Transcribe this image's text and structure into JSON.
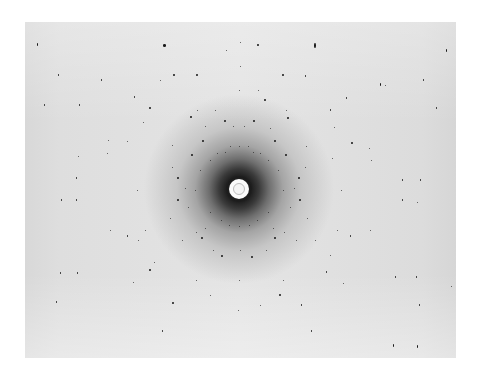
{
  "image": {
    "description": "X-ray diffraction photograph with concentric rings of dark reflection spots around a central white beam stop",
    "background_color": "#ffffff",
    "plate_color": "#e2e2e2",
    "spot_color": "#1a1a1a",
    "center": {
      "x": 239,
      "y": 189
    },
    "beam_stop_radius": 10
  },
  "spots": [
    [
      37,
      44,
      1,
      3
    ],
    [
      164,
      45,
      3,
      3
    ],
    [
      315,
      45,
      2,
      5
    ],
    [
      446,
      50,
      1,
      3
    ],
    [
      240,
      42,
      1,
      1
    ],
    [
      258,
      45,
      2,
      2
    ],
    [
      226,
      50,
      1,
      1
    ],
    [
      58,
      75,
      1,
      2
    ],
    [
      101,
      80,
      1,
      2
    ],
    [
      174,
      75,
      2,
      2
    ],
    [
      197,
      75,
      2,
      2
    ],
    [
      240,
      66,
      1,
      1
    ],
    [
      283,
      75,
      2,
      2
    ],
    [
      305,
      76,
      1,
      2
    ],
    [
      380,
      84,
      1,
      3
    ],
    [
      423,
      80,
      1,
      2
    ],
    [
      44,
      105,
      1,
      2
    ],
    [
      79,
      105,
      1,
      2
    ],
    [
      134,
      97,
      1,
      2
    ],
    [
      160,
      80,
      1,
      1
    ],
    [
      239,
      90,
      1,
      1
    ],
    [
      258,
      90,
      1,
      1
    ],
    [
      265,
      100,
      2,
      2
    ],
    [
      346,
      98,
      1,
      2
    ],
    [
      385,
      85,
      1,
      1
    ],
    [
      436,
      108,
      1,
      2
    ],
    [
      150,
      108,
      2,
      2
    ],
    [
      197,
      110,
      1,
      1
    ],
    [
      215,
      110,
      1,
      1
    ],
    [
      286,
      110,
      1,
      1
    ],
    [
      330,
      110,
      1,
      2
    ],
    [
      191,
      117,
      2,
      2
    ],
    [
      225,
      121,
      2,
      2
    ],
    [
      254,
      121,
      2,
      2
    ],
    [
      288,
      118,
      2,
      2
    ],
    [
      143,
      122,
      1,
      1
    ],
    [
      334,
      127,
      1,
      1
    ],
    [
      233,
      126,
      1,
      1
    ],
    [
      244,
      126,
      1,
      1
    ],
    [
      205,
      126,
      1,
      1
    ],
    [
      270,
      128,
      1,
      1
    ],
    [
      108,
      140,
      1,
      1
    ],
    [
      127,
      141,
      1,
      1
    ],
    [
      203,
      141,
      2,
      2
    ],
    [
      275,
      141,
      2,
      2
    ],
    [
      306,
      146,
      1,
      1
    ],
    [
      352,
      143,
      2,
      2
    ],
    [
      369,
      148,
      1,
      1
    ],
    [
      78,
      156,
      1,
      1
    ],
    [
      107,
      153,
      1,
      1
    ],
    [
      172,
      145,
      1,
      1
    ],
    [
      239,
      146,
      1,
      1
    ],
    [
      230,
      146,
      1,
      1
    ],
    [
      248,
      146,
      1,
      1
    ],
    [
      217,
      153,
      1,
      1
    ],
    [
      260,
      153,
      1,
      1
    ],
    [
      192,
      155,
      2,
      2
    ],
    [
      286,
      155,
      2,
      2
    ],
    [
      225,
      152,
      1,
      1
    ],
    [
      253,
      152,
      1,
      1
    ],
    [
      332,
      158,
      1,
      1
    ],
    [
      371,
      160,
      1,
      1
    ],
    [
      210,
      160,
      1,
      1
    ],
    [
      268,
      160,
      1,
      1
    ],
    [
      200,
      170,
      1,
      1
    ],
    [
      278,
      170,
      1,
      1
    ],
    [
      178,
      178,
      2,
      2
    ],
    [
      299,
      178,
      2,
      2
    ],
    [
      172,
      167,
      1,
      1
    ],
    [
      305,
      167,
      1,
      1
    ],
    [
      76,
      178,
      1,
      2
    ],
    [
      402,
      180,
      1,
      2
    ],
    [
      420,
      180,
      1,
      2
    ],
    [
      185,
      188,
      1,
      1
    ],
    [
      294,
      188,
      1,
      1
    ],
    [
      195,
      190,
      1,
      1
    ],
    [
      283,
      190,
      1,
      1
    ],
    [
      137,
      190,
      1,
      1
    ],
    [
      341,
      190,
      1,
      1
    ],
    [
      61,
      200,
      1,
      2
    ],
    [
      76,
      200,
      1,
      2
    ],
    [
      402,
      200,
      1,
      2
    ],
    [
      417,
      202,
      1,
      1
    ],
    [
      178,
      200,
      2,
      2
    ],
    [
      300,
      200,
      2,
      2
    ],
    [
      188,
      207,
      1,
      1
    ],
    [
      290,
      207,
      1,
      1
    ],
    [
      210,
      212,
      1,
      1
    ],
    [
      268,
      212,
      1,
      1
    ],
    [
      170,
      218,
      1,
      1
    ],
    [
      307,
      218,
      1,
      1
    ],
    [
      221,
      220,
      1,
      1
    ],
    [
      257,
      220,
      1,
      1
    ],
    [
      229,
      225,
      1,
      1
    ],
    [
      239,
      226,
      1,
      1
    ],
    [
      249,
      225,
      1,
      1
    ],
    [
      205,
      228,
      1,
      1
    ],
    [
      273,
      228,
      1,
      1
    ],
    [
      196,
      232,
      1,
      1
    ],
    [
      284,
      232,
      1,
      1
    ],
    [
      145,
      230,
      1,
      1
    ],
    [
      337,
      230,
      1,
      1
    ],
    [
      110,
      230,
      1,
      1
    ],
    [
      370,
      230,
      1,
      1
    ],
    [
      127,
      236,
      1,
      2
    ],
    [
      350,
      236,
      1,
      2
    ],
    [
      202,
      238,
      2,
      2
    ],
    [
      275,
      238,
      2,
      2
    ],
    [
      182,
      240,
      1,
      1
    ],
    [
      296,
      240,
      1,
      1
    ],
    [
      138,
      240,
      1,
      1
    ],
    [
      315,
      240,
      1,
      1
    ],
    [
      222,
      256,
      2,
      2
    ],
    [
      252,
      257,
      2,
      2
    ],
    [
      240,
      250,
      1,
      1
    ],
    [
      213,
      250,
      1,
      1
    ],
    [
      266,
      250,
      1,
      1
    ],
    [
      330,
      255,
      1,
      1
    ],
    [
      154,
      262,
      1,
      1
    ],
    [
      60,
      273,
      1,
      2
    ],
    [
      77,
      273,
      1,
      2
    ],
    [
      150,
      270,
      2,
      2
    ],
    [
      326,
      272,
      1,
      2
    ],
    [
      395,
      277,
      1,
      2
    ],
    [
      416,
      277,
      1,
      2
    ],
    [
      133,
      282,
      1,
      1
    ],
    [
      239,
      280,
      1,
      1
    ],
    [
      196,
      280,
      1,
      1
    ],
    [
      283,
      280,
      1,
      1
    ],
    [
      343,
      283,
      1,
      1
    ],
    [
      56,
      302,
      1,
      2
    ],
    [
      173,
      303,
      2,
      2
    ],
    [
      280,
      295,
      2,
      2
    ],
    [
      301,
      305,
      1,
      2
    ],
    [
      419,
      305,
      1,
      2
    ],
    [
      238,
      310,
      1,
      1
    ],
    [
      162,
      331,
      1,
      2
    ],
    [
      311,
      331,
      1,
      2
    ],
    [
      393,
      345,
      1,
      3
    ],
    [
      417,
      346,
      1,
      3
    ],
    [
      451,
      286,
      1,
      1
    ],
    [
      210,
      295,
      1,
      1
    ],
    [
      260,
      305,
      1,
      1
    ]
  ]
}
